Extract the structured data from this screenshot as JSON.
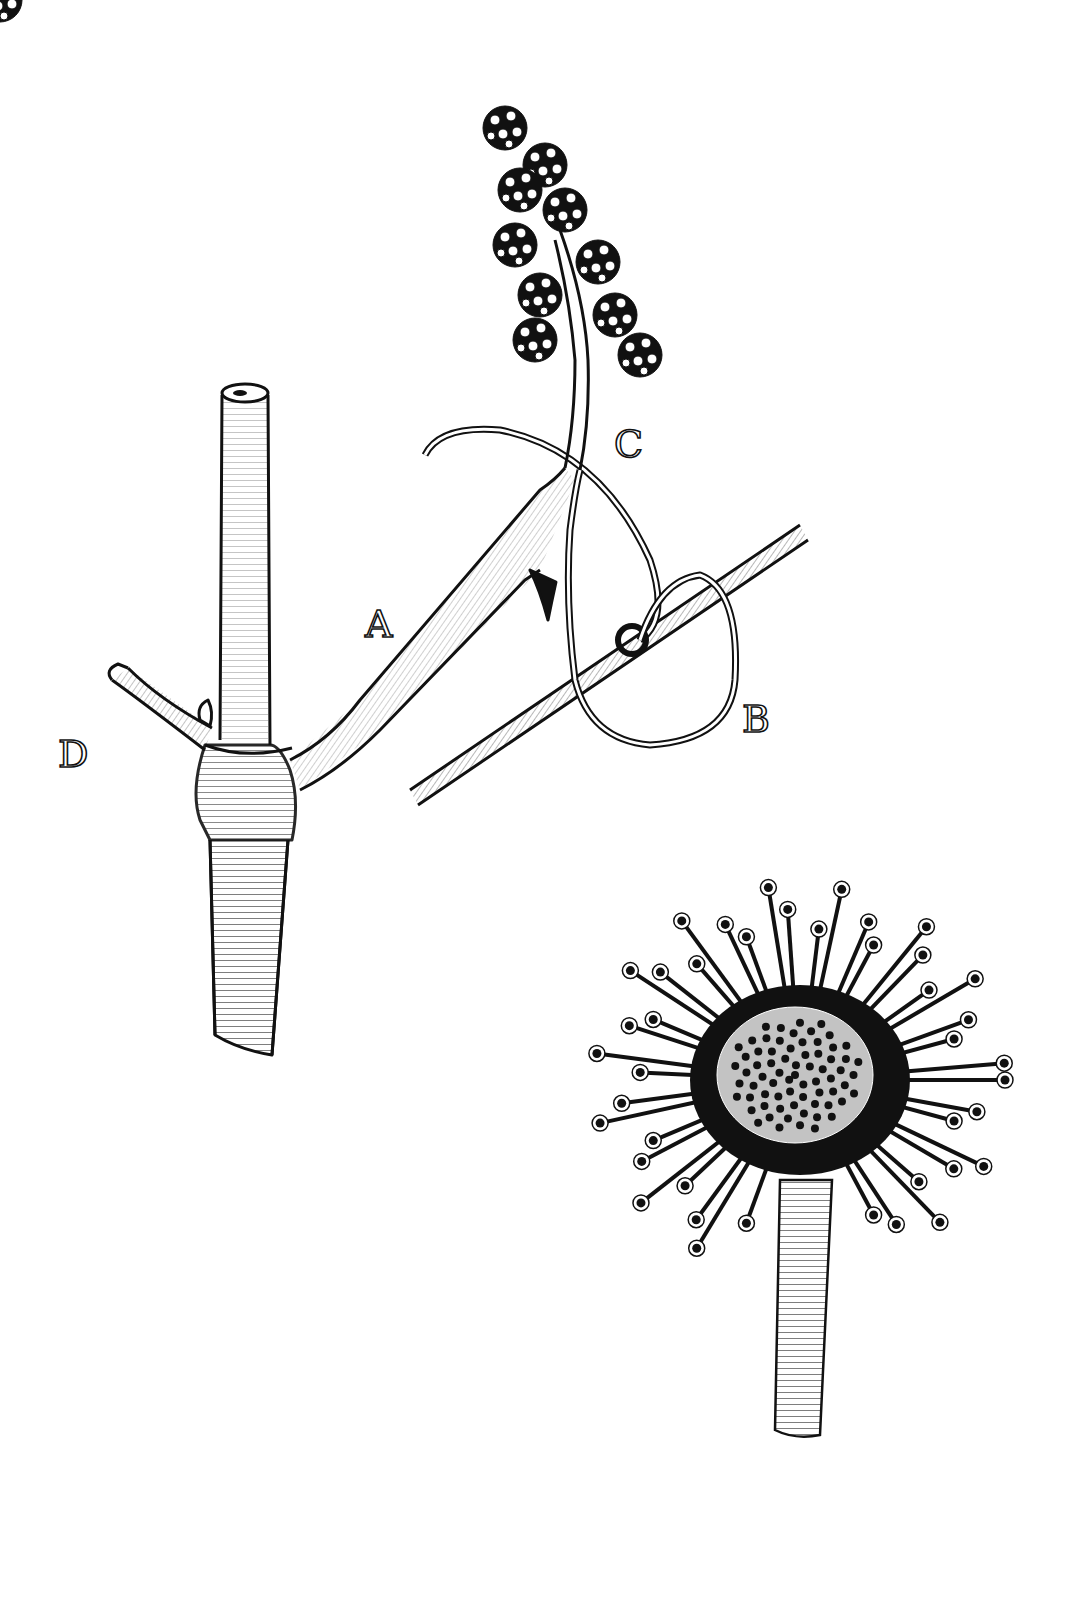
{
  "figure": {
    "type": "botanical engraving",
    "style": "black-and-white line engraving",
    "background": "#ffffff",
    "ink": "#111111"
  },
  "labels": [
    {
      "id": "A",
      "text": "A",
      "x": 365,
      "y": 605,
      "refers_to": "flower peduncle / tendril branch"
    },
    {
      "id": "B",
      "text": "B",
      "x": 742,
      "y": 700,
      "refers_to": "coiled tendril around support"
    },
    {
      "id": "C",
      "text": "C",
      "x": 614,
      "y": 425,
      "refers_to": "secondary peduncle bearing flower cluster"
    },
    {
      "id": "D",
      "text": "D",
      "x": 58,
      "y": 735,
      "refers_to": "cut petiole / side branch"
    }
  ],
  "figures": [
    {
      "name": "vine-stem-with-tendril",
      "description": "Cut vine stem with branching flower peduncle, inflorescence and tendril coiled around a twig"
    },
    {
      "name": "sundew-leaf",
      "description": "Round leaf covered in glandular tentacles on a hairy petiole"
    }
  ]
}
